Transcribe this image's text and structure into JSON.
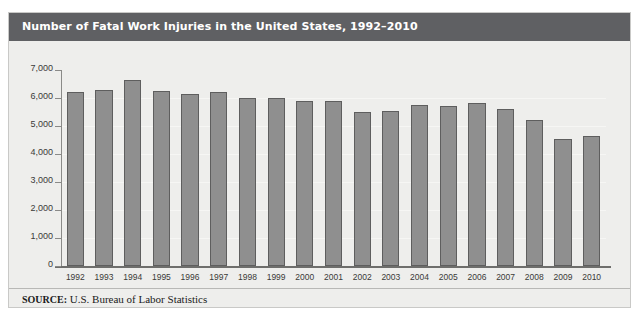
{
  "figure": {
    "title": "Number of Fatal Work Injuries in the United States, 1992–2010",
    "source_label": "SOURCE:",
    "source_text": " U.S. Bureau of Labor Statistics",
    "title_bar_color": "#5f6063",
    "background_color": "#eeeeec",
    "bar_fill_color": "#8f8f8f",
    "bar_border_color": "#5e5e5e"
  },
  "chart_data": {
    "type": "bar",
    "title": "Number of Fatal Work Injuries in the United States, 1992–2010",
    "xlabel": "",
    "ylabel": "",
    "ylim": [
      0,
      7000
    ],
    "ytick_values": [
      0,
      1000,
      2000,
      3000,
      4000,
      5000,
      6000,
      7000
    ],
    "ytick_labels": [
      "0",
      "1,000",
      "2,000",
      "3,000",
      "4,000",
      "5,000",
      "6,000",
      "7,000"
    ],
    "grid": true,
    "legend": false,
    "categories": [
      "1992",
      "1993",
      "1994",
      "1995",
      "1996",
      "1997",
      "1998",
      "1999",
      "2000",
      "2001",
      "2002",
      "2003",
      "2004",
      "2005",
      "2006",
      "2007",
      "2008",
      "2009",
      "2010"
    ],
    "values": [
      6200,
      6300,
      6650,
      6250,
      6150,
      6200,
      6000,
      6000,
      5900,
      5900,
      5500,
      5530,
      5740,
      5700,
      5810,
      5620,
      5200,
      4550,
      4650
    ]
  }
}
